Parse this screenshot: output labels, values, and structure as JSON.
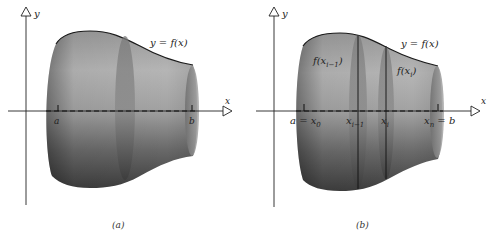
{
  "figure": {
    "panels": [
      {
        "id": "a",
        "caption": "(a)",
        "labels": {
          "y_axis": "y",
          "x_axis": "x",
          "curve": "y = f(x)",
          "left_bound": "a",
          "right_bound": "b"
        }
      },
      {
        "id": "b",
        "caption": "(b)",
        "labels": {
          "y_axis": "y",
          "x_axis": "x",
          "curve": "y = f(x)",
          "left_bound": "a = x",
          "left_bound_sub": "0",
          "x_prev": "x",
          "x_prev_sub": "i−1",
          "x_i": "x",
          "x_i_sub": "i",
          "right_bound": "x",
          "right_bound_sub": "n",
          "right_bound_eq": " = b",
          "f_prev": "f(x",
          "f_prev_sub": "i−1",
          "f_prev_close": ")",
          "f_i": "f(x",
          "f_i_sub": "i",
          "f_i_close": ")"
        }
      }
    ]
  }
}
